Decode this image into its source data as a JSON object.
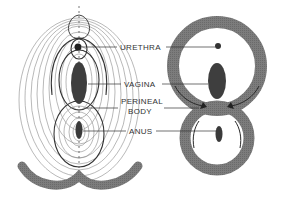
{
  "figure": {
    "type": "anatomical-diagram",
    "left_panel": "concentric-muscle-rings-frontal-view",
    "right_panel": "figure-eight-muscle-loops"
  },
  "labels": {
    "urethra": "URETHRA",
    "vagina": "VAGINA",
    "perineal_body_line1": "PERINEAL",
    "perineal_body_line2": "BODY",
    "anus": "ANUS"
  },
  "colors": {
    "muscle": "#7a7a7a",
    "organ": "#3e3e3e",
    "line": "#333333",
    "contour": "#888888"
  }
}
